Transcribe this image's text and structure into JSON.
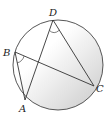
{
  "diagram": {
    "points": [
      {
        "id": "A",
        "label": "A"
      },
      {
        "id": "B",
        "label": "B"
      },
      {
        "id": "C",
        "label": "C"
      },
      {
        "id": "D",
        "label": "D"
      }
    ],
    "segments": [
      {
        "from": "B",
        "to": "A"
      },
      {
        "from": "B",
        "to": "C"
      },
      {
        "from": "D",
        "to": "A"
      },
      {
        "from": "D",
        "to": "C"
      }
    ],
    "marked_angles": [
      "ABC",
      "ADC"
    ],
    "colors": {
      "stroke": "#333333",
      "shade_light": "#ffffff",
      "shade_dark": "#cfcfcf"
    }
  }
}
